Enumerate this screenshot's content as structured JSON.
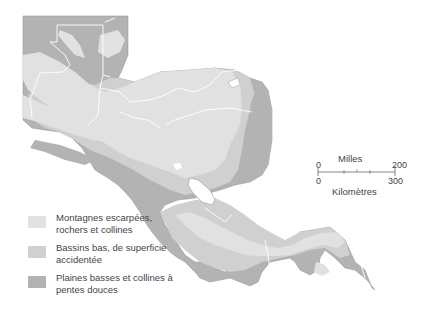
{
  "map": {
    "region": "Central America",
    "colors": {
      "background": "#ffffff",
      "steep_mountains": "#e1e1e1",
      "low_basins": "#d0d0d0",
      "plains": "#b3b3b3",
      "borders": "#ffffff",
      "coast": "#9a9a9a"
    }
  },
  "legend": {
    "items": [
      {
        "label": "Montagnes escarpées, rochers et collines",
        "color": "#e1e1e1"
      },
      {
        "label": "Bassins bas, de superficie accidentée",
        "color": "#d0d0d0"
      },
      {
        "label": "Plaines basses et collines à pentes douces",
        "color": "#b3b3b3"
      }
    ]
  },
  "scale": {
    "miles_label": "Milles",
    "km_label": "Kilomètres",
    "miles_start": "0",
    "miles_end": "200",
    "km_start": "0",
    "km_end": "300"
  }
}
